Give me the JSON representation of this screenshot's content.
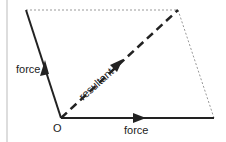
{
  "diagram": {
    "labels": {
      "force_left": "force",
      "force_bottom": "force",
      "resultant": "resultant",
      "origin": "O"
    },
    "colors": {
      "line": "#222222",
      "dotted": "#999999",
      "border": "#bbbbbb"
    }
  }
}
